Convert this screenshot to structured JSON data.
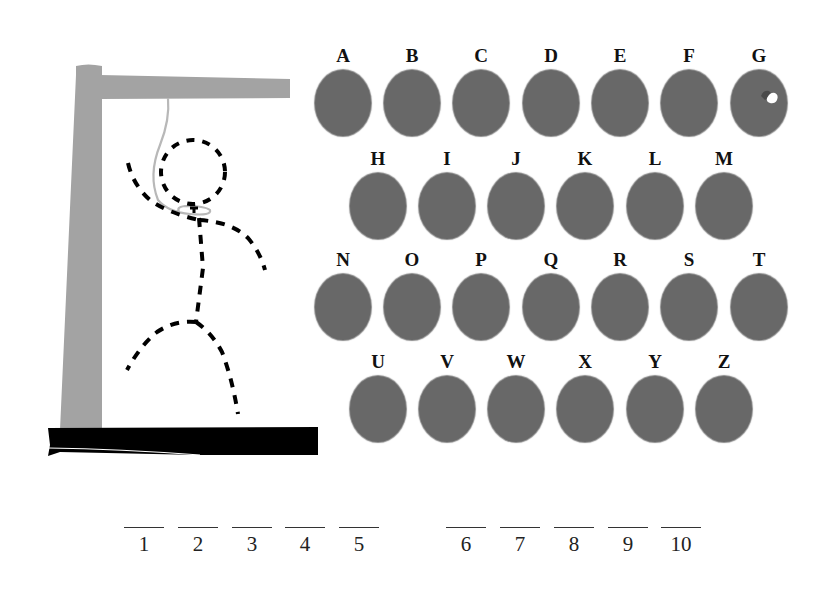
{
  "game": {
    "type": "hangman",
    "colors": {
      "gallows": "#a3a3a3",
      "base": "#000000",
      "rope": "#b5b5b5",
      "figure": "#000000",
      "letter_disc": "#686868",
      "label": "#111111"
    },
    "figure_parts_drawn": [
      "head",
      "body",
      "left-arm",
      "right-arm",
      "left-leg",
      "right-leg",
      "rope"
    ]
  },
  "keyboard": {
    "rows": [
      [
        {
          "letter": "A"
        },
        {
          "letter": "B"
        },
        {
          "letter": "C"
        },
        {
          "letter": "D"
        },
        {
          "letter": "E"
        },
        {
          "letter": "F"
        },
        {
          "letter": "G",
          "hovered": true
        }
      ],
      [
        {
          "letter": "H"
        },
        {
          "letter": "I"
        },
        {
          "letter": "J"
        },
        {
          "letter": "K"
        },
        {
          "letter": "L"
        },
        {
          "letter": "M"
        }
      ],
      [
        {
          "letter": "N"
        },
        {
          "letter": "O"
        },
        {
          "letter": "P"
        },
        {
          "letter": "Q"
        },
        {
          "letter": "R"
        },
        {
          "letter": "S"
        },
        {
          "letter": "T"
        }
      ],
      [
        {
          "letter": "U"
        },
        {
          "letter": "V"
        },
        {
          "letter": "W"
        },
        {
          "letter": "X"
        },
        {
          "letter": "Y"
        },
        {
          "letter": "Z"
        }
      ]
    ],
    "cursor_icon": "hand-cursor-icon"
  },
  "word": {
    "blanks": [
      {
        "number": "1",
        "value": ""
      },
      {
        "number": "2",
        "value": ""
      },
      {
        "number": "3",
        "value": ""
      },
      {
        "number": "4",
        "value": ""
      },
      {
        "number": "5",
        "value": ""
      },
      {
        "number": "6",
        "value": ""
      },
      {
        "number": "7",
        "value": ""
      },
      {
        "number": "8",
        "value": ""
      },
      {
        "number": "9",
        "value": ""
      },
      {
        "number": "10",
        "value": ""
      }
    ]
  }
}
